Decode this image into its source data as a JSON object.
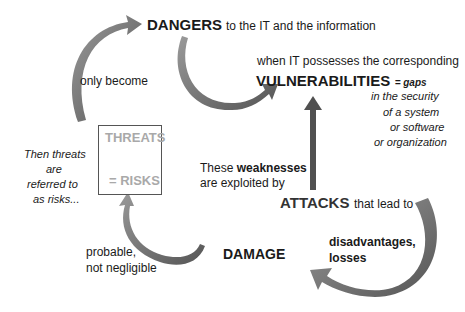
{
  "diagram": {
    "nodes": {
      "dangers": {
        "keyword": "DANGERS",
        "rest": "to the IT and the information"
      },
      "vulnerabilities": {
        "intro": "when IT possesses the corresponding",
        "keyword": "VULNERABILITIES",
        "definition_lead": "= gaps",
        "definition_lines": [
          "in the security",
          "of a system",
          "or software",
          "or organization"
        ]
      },
      "weaknesses": {
        "line1_pre": "These",
        "line1_keyword": "weaknesses",
        "line2": "are exploited by"
      },
      "attacks": {
        "keyword": "ATTACKS",
        "rest": "that lead to"
      },
      "disadvantages": {
        "line1": "disadvantages,",
        "line2": "losses"
      },
      "damage": {
        "keyword": "DAMAGE"
      },
      "probable": {
        "line1": "probable,",
        "line2": "not negligible"
      },
      "threats_box": {
        "top": "THREATS",
        "bottom": "= RISKS"
      },
      "then_threats": {
        "lines": [
          "Then threats",
          "are",
          "referred to",
          "as risks..."
        ]
      },
      "only_become": {
        "text": "only become"
      }
    },
    "colors": {
      "arrow_fill": "#7a7a7a",
      "arrow_dark": "#505050",
      "box_text": "#a9a9a9",
      "text": "#1a1a1a"
    }
  }
}
